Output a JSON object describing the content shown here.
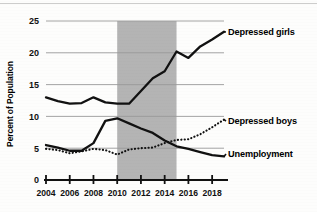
{
  "chart_data": {
    "type": "line",
    "title": "",
    "xlabel": "",
    "ylabel": "Percent of Population",
    "xlim": [
      2004,
      2019
    ],
    "ylim": [
      0,
      25
    ],
    "yticks": [
      0,
      5,
      10,
      15,
      20,
      25
    ],
    "ytick_labels": [
      "0",
      "5",
      "10",
      "15",
      "20",
      "25"
    ],
    "xticks": [
      2004,
      2006,
      2008,
      2010,
      2012,
      2014,
      2016,
      2018
    ],
    "xtick_labels": [
      "2004",
      "2006",
      "2008",
      "2010",
      "2012",
      "2014",
      "2016",
      "2018"
    ],
    "grid": true,
    "grid_axis": "y",
    "legend_position": "right-inline-labels",
    "shaded_region": {
      "label": "",
      "x_start": 2010,
      "x_end": 2015,
      "color": "#b4b4b4"
    },
    "x": [
      2004,
      2005,
      2006,
      2007,
      2008,
      2009,
      2010,
      2011,
      2012,
      2013,
      2014,
      2015,
      2016,
      2017,
      2018,
      2019
    ],
    "series": [
      {
        "name": "Depressed girls",
        "style": "solid",
        "color": "#111111",
        "values": [
          13.0,
          12.4,
          12.0,
          12.1,
          13.0,
          12.2,
          12.0,
          12.0,
          14.0,
          16.0,
          17.1,
          20.2,
          19.2,
          21.0,
          22.1,
          23.3
        ]
      },
      {
        "name": "Depressed boys",
        "style": "dotted",
        "color": "#111111",
        "values": [
          4.9,
          4.7,
          4.2,
          4.5,
          4.9,
          4.7,
          4.0,
          4.8,
          5.0,
          5.1,
          5.8,
          6.3,
          6.4,
          7.2,
          8.3,
          9.5
        ]
      },
      {
        "name": "Unemployment",
        "style": "solid",
        "color": "#111111",
        "values": [
          5.5,
          5.1,
          4.6,
          4.6,
          5.8,
          9.3,
          9.7,
          8.9,
          8.1,
          7.4,
          6.2,
          5.3,
          4.9,
          4.4,
          3.9,
          3.7
        ]
      }
    ],
    "annotations": [
      {
        "text": "Depressed girls",
        "series": "Depressed girls"
      },
      {
        "text": "Depressed boys",
        "series": "Depressed boys"
      },
      {
        "text": "Unemployment",
        "series": "Unemployment"
      }
    ]
  },
  "colors": {
    "line": "#111111",
    "grid": "#9a9a9a",
    "axis": "#111111",
    "shade": "#b4b4b4",
    "background": "#fdfdfc"
  }
}
